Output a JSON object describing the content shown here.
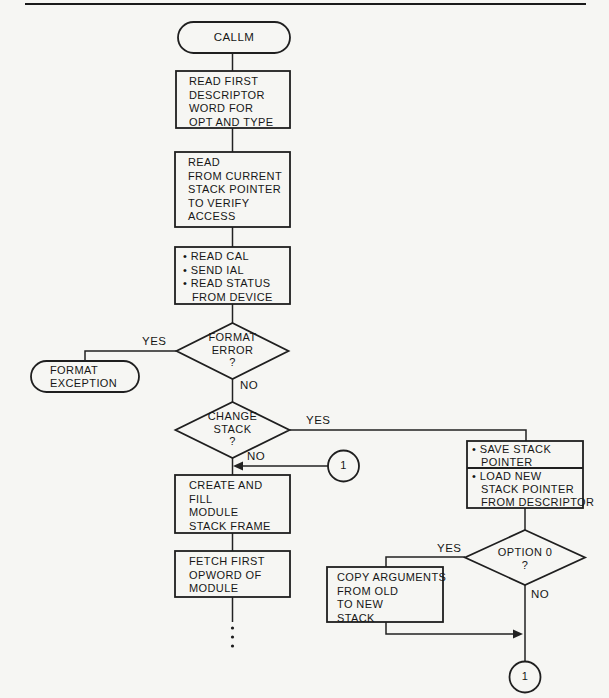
{
  "page": {
    "background": "#f6f6f3",
    "line_color": "#1f1f1f"
  },
  "nodes": {
    "start": {
      "type": "terminator",
      "label": "CALLM"
    },
    "read_first": {
      "type": "process",
      "lines": [
        "READ FIRST",
        "DESCRIPTOR",
        "WORD FOR",
        "OPT AND TYPE"
      ]
    },
    "read_current": {
      "type": "process",
      "lines": [
        "READ",
        "FROM CURRENT",
        "STACK POINTER",
        "TO VERIFY",
        "ACCESS"
      ]
    },
    "read_cal": {
      "type": "process",
      "lines": [
        "• READ CAL",
        "• SEND IAL",
        "• READ STATUS",
        "FROM DEVICE"
      ]
    },
    "format_error": {
      "type": "decision",
      "lines": [
        "FORMAT",
        "ERROR",
        "?"
      ]
    },
    "format_exception": {
      "type": "terminator",
      "lines": [
        "FORMAT",
        "EXCEPTION"
      ]
    },
    "change_stack": {
      "type": "decision",
      "lines": [
        "CHANGE",
        "STACK",
        "?"
      ]
    },
    "connector_mid": {
      "type": "connector",
      "label": "1"
    },
    "create_fill": {
      "type": "process",
      "lines": [
        "CREATE AND",
        "FILL",
        "MODULE",
        "STACK FRAME"
      ]
    },
    "fetch_first": {
      "type": "process",
      "lines": [
        "FETCH FIRST",
        "OPWORD OF",
        "MODULE"
      ]
    },
    "save_load_stack": {
      "type": "process",
      "upper_lines": [
        "• SAVE STACK",
        "POINTER"
      ],
      "lower_lines": [
        "• LOAD NEW",
        "STACK POINTER",
        "FROM DESCRIPTOR"
      ]
    },
    "option0": {
      "type": "decision",
      "lines": [
        "OPTION 0",
        "?"
      ]
    },
    "copy_args": {
      "type": "process",
      "lines": [
        "COPY ARGUMENTS",
        "FROM OLD",
        "TO NEW",
        "STACK"
      ]
    },
    "connector_bottom": {
      "type": "connector",
      "label": "1"
    }
  },
  "edge_labels": {
    "yes_format": "YES",
    "no_format": "NO",
    "yes_change": "YES",
    "no_change": "NO",
    "yes_option": "YES",
    "no_option": "NO"
  }
}
